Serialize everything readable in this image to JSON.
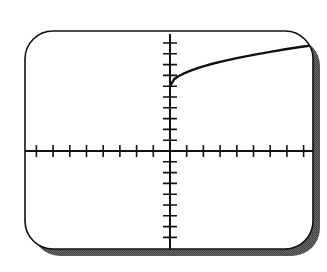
{
  "chart_data": {
    "type": "line",
    "title": "",
    "xlabel": "",
    "ylabel": "",
    "xlim": [
      -8.7,
      8.6
    ],
    "ylim": [
      -9.1,
      11.1
    ],
    "x_tick_step": 1,
    "y_tick_step": 1,
    "x_ticks": [
      -8,
      -7,
      -6,
      -5,
      -4,
      -3,
      -2,
      -1,
      1,
      2,
      3,
      4,
      5,
      6,
      7,
      8
    ],
    "y_ticks": [
      -8,
      -7,
      -6,
      -5,
      -4,
      -3,
      -2,
      -1,
      1,
      2,
      3,
      4,
      5,
      6,
      7,
      8,
      9,
      10
    ],
    "tick_labels_shown": false,
    "grid": false,
    "legend": null,
    "series": [
      {
        "name": "curve",
        "description": "square-root shaped curve starting at (0, 6), increasing and concave down",
        "x": [
          0,
          0.25,
          0.5,
          0.8,
          1.2,
          1.7,
          2.2,
          2.6,
          3,
          4,
          5,
          6,
          7,
          8,
          8.6
        ],
        "y": [
          6.0,
          6.65,
          6.92,
          7.16,
          7.42,
          7.7,
          7.93,
          8.1,
          8.25,
          8.6,
          8.9,
          9.18,
          9.44,
          9.68,
          9.8
        ]
      }
    ]
  },
  "screen": {
    "frame_color": "#111111",
    "shadow_color": "#5a5a5a",
    "background_color": "#ffffff",
    "curve_color": "#111111",
    "axis_color": "#111111"
  }
}
